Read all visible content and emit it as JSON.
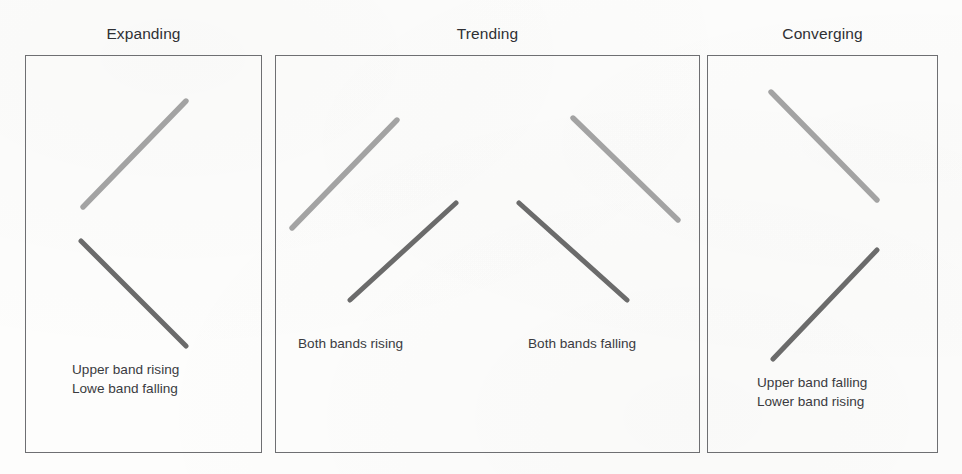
{
  "figure": {
    "background_color": "#fdfdfc",
    "border_color": "#6e6f72",
    "title_color": "#2f3034",
    "caption_color": "#3a3b3f",
    "upper_band_color": "#a3a3a3",
    "lower_band_color": "#6b6b6b"
  },
  "panels": [
    {
      "id": "expanding",
      "title": "Expanding",
      "captions": [
        "Upper band rising",
        "Lowe band falling"
      ]
    },
    {
      "id": "trending",
      "title": "Trending",
      "captions": [
        "Both bands rising",
        "Both bands falling"
      ]
    },
    {
      "id": "converging",
      "title": "Converging",
      "captions": [
        "Upper band falling",
        "Lower band rising"
      ]
    }
  ],
  "chart_data": {
    "type": "line",
    "title": "",
    "subtitle": "",
    "xlabel": "",
    "ylabel": "",
    "grid": false,
    "legend": "none",
    "panels": [
      {
        "name": "Expanding",
        "annotations": [
          "Upper band rising",
          "Lowe band falling"
        ],
        "series": [
          {
            "name": "Upper band",
            "role": "upper",
            "color": "#a3a3a3",
            "direction": "rising",
            "x": [
              83,
              186
            ],
            "y": [
              207,
              101
            ]
          },
          {
            "name": "Lower band",
            "role": "lower",
            "color": "#6b6b6b",
            "direction": "falling",
            "x": [
              81,
              186
            ],
            "y": [
              241,
              346
            ]
          }
        ]
      },
      {
        "name": "Trending",
        "annotations": [
          "Both bands rising",
          "Both bands falling"
        ],
        "series": [
          {
            "name": "Upper band (rising group)",
            "role": "upper",
            "color": "#a3a3a3",
            "direction": "rising",
            "x": [
              292,
              397
            ],
            "y": [
              228,
              120
            ]
          },
          {
            "name": "Lower band (rising group)",
            "role": "lower",
            "color": "#6b6b6b",
            "direction": "rising",
            "x": [
              350,
              456
            ],
            "y": [
              300,
              203
            ]
          },
          {
            "name": "Upper band (falling group)",
            "role": "upper",
            "color": "#a3a3a3",
            "direction": "falling",
            "x": [
              573,
              678
            ],
            "y": [
              118,
              220
            ]
          },
          {
            "name": "Lower band (falling group)",
            "role": "lower",
            "color": "#6b6b6b",
            "direction": "falling",
            "x": [
              519,
              627
            ],
            "y": [
              203,
              300
            ]
          }
        ]
      },
      {
        "name": "Converging",
        "annotations": [
          "Upper band falling",
          "Lower band rising"
        ],
        "series": [
          {
            "name": "Upper band",
            "role": "upper",
            "color": "#a3a3a3",
            "direction": "falling",
            "x": [
              771,
              877
            ],
            "y": [
              92,
              200
            ]
          },
          {
            "name": "Lower band",
            "role": "lower",
            "color": "#6b6b6b",
            "direction": "rising",
            "x": [
              773,
              877
            ],
            "y": [
              359,
              250
            ]
          }
        ]
      }
    ]
  }
}
